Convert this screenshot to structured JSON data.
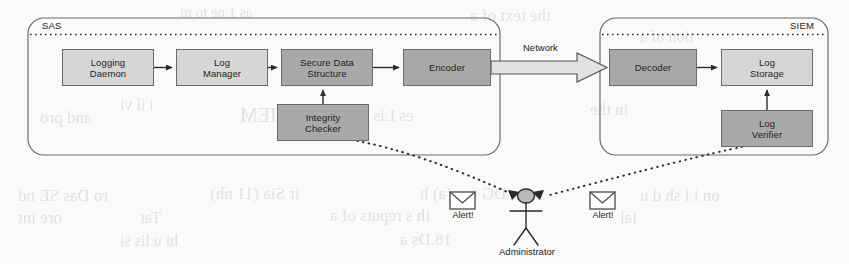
{
  "diagram": {
    "zones": [
      {
        "id": "sas",
        "label": "SAS",
        "x": 28,
        "y": 18,
        "w": 472,
        "h": 137
      },
      {
        "id": "siem",
        "label": "SIEM",
        "x": 600,
        "y": 18,
        "w": 228,
        "h": 137
      }
    ],
    "nodes": [
      {
        "id": "logging-daemon",
        "label": "Logging\nDaemon",
        "shade": "light",
        "x": 62,
        "y": 49,
        "w": 92,
        "h": 37
      },
      {
        "id": "log-manager",
        "label": "Log\nManager",
        "shade": "light",
        "x": 176,
        "y": 49,
        "w": 92,
        "h": 37
      },
      {
        "id": "secure-data",
        "label": "Secure Data\nStructure",
        "shade": "dark",
        "x": 281,
        "y": 49,
        "w": 92,
        "h": 37
      },
      {
        "id": "encoder",
        "label": "Encoder",
        "shade": "dark",
        "x": 403,
        "y": 49,
        "w": 88,
        "h": 37
      },
      {
        "id": "integrity-checker",
        "label": "Integrity\nChecker",
        "shade": "dark",
        "x": 277,
        "y": 104,
        "w": 92,
        "h": 37
      },
      {
        "id": "decoder",
        "label": "Decoder",
        "shade": "dark",
        "x": 609,
        "y": 49,
        "w": 88,
        "h": 37
      },
      {
        "id": "log-storage",
        "label": "Log\nStorage",
        "shade": "light",
        "x": 721,
        "y": 49,
        "w": 92,
        "h": 37
      },
      {
        "id": "log-verifier",
        "label": "Log\nVerifier",
        "shade": "dark",
        "x": 721,
        "y": 110,
        "w": 92,
        "h": 37
      }
    ],
    "edges": [
      {
        "from": "logging-daemon",
        "to": "log-manager",
        "style": "solid-arrow"
      },
      {
        "from": "log-manager",
        "to": "secure-data",
        "style": "solid-arrow"
      },
      {
        "from": "secure-data",
        "to": "encoder",
        "style": "solid-arrow"
      },
      {
        "from": "integrity-checker",
        "to": "secure-data",
        "style": "solid-arrow"
      },
      {
        "from": "encoder",
        "to": "decoder",
        "style": "block-arrow",
        "label": "Network"
      },
      {
        "from": "decoder",
        "to": "log-storage",
        "style": "solid-arrow"
      },
      {
        "from": "log-verifier",
        "to": "log-storage",
        "style": "solid-arrow"
      },
      {
        "from": "integrity-checker",
        "to": "administrator",
        "style": "dotted"
      },
      {
        "from": "log-verifier",
        "to": "administrator",
        "style": "dotted"
      }
    ],
    "network_label": "Network",
    "actor": {
      "id": "administrator",
      "label": "Administrator",
      "x": 516,
      "y": 197
    },
    "alerts": [
      {
        "id": "alert-left",
        "label": "Alert!",
        "x": 446,
        "y": 192
      },
      {
        "id": "alert-right",
        "label": "Alert!",
        "x": 586,
        "y": 192
      }
    ],
    "colors": {
      "light_fill": "#d6d6d6",
      "dark_fill": "#a9a9a9",
      "stroke": "#6b6b6b",
      "text": "#1d1d1d",
      "page_bg": "#fbfaf8"
    }
  },
  "bleed_text": [
    {
      "t": "the text of a",
      "x": 470,
      "y": 6,
      "size": 17
    },
    {
      "t": "as 1 ne to ni",
      "x": 180,
      "y": 4,
      "size": 15
    },
    {
      "t": "tion of a",
      "x": 640,
      "y": 28,
      "size": 16
    },
    {
      "t": "i il vi",
      "x": 120,
      "y": 96,
      "size": 16
    },
    {
      "t": "and pro",
      "x": 40,
      "y": 108,
      "size": 17
    },
    {
      "t": "SIEM",
      "x": 240,
      "y": 104,
      "size": 20
    },
    {
      "t": "es Lis tay as",
      "x": 330,
      "y": 106,
      "size": 17
    },
    {
      "t": "in the",
      "x": 590,
      "y": 100,
      "size": 17
    },
    {
      "t": "ro Das SE nd",
      "x": 18,
      "y": 186,
      "size": 17
    },
    {
      "t": "ir Sia (11 nh)",
      "x": 210,
      "y": 184,
      "size": 17
    },
    {
      "t": "DG (an (a) h",
      "x": 420,
      "y": 184,
      "size": 17
    },
    {
      "t": "on i l sh d u",
      "x": 640,
      "y": 186,
      "size": 17
    },
    {
      "t": "ore int",
      "x": 18,
      "y": 208,
      "size": 17
    },
    {
      "t": "Tat",
      "x": 140,
      "y": 208,
      "size": 17
    },
    {
      "t": "ih s reputs of a",
      "x": 330,
      "y": 206,
      "size": 17
    },
    {
      "t": "lal",
      "x": 620,
      "y": 208,
      "size": 17
    },
    {
      "t": "hi u lis si",
      "x": 120,
      "y": 232,
      "size": 16
    },
    {
      "t": "18.Ds a",
      "x": 400,
      "y": 230,
      "size": 17
    }
  ]
}
